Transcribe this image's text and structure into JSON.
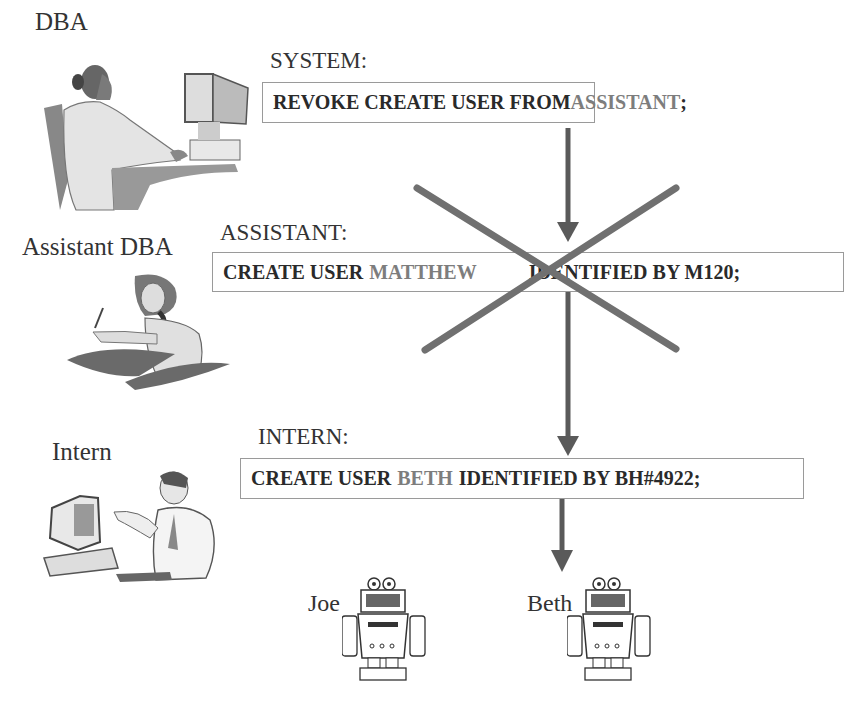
{
  "actors": [
    {
      "id": "dba",
      "label": "DBA",
      "icon": "woman-at-computer-icon"
    },
    {
      "id": "assistant",
      "label": "Assistant DBA",
      "icon": "woman-on-phone-icon"
    },
    {
      "id": "intern",
      "label": "Intern",
      "icon": "man-at-computer-icon"
    }
  ],
  "steps": [
    {
      "role": "SYSTEM:",
      "command": {
        "kw1": "REVOKE CREATE USER FROM",
        "target": "ASSISTANT",
        "end": ";"
      }
    },
    {
      "role": "ASSISTANT:",
      "command": {
        "kw1": "CREATE USER",
        "target": "MATTHEW",
        "kw2": "IDENTIFIED BY M120;"
      },
      "status": "crossed-out"
    },
    {
      "role": "INTERN:",
      "command": {
        "kw1": "CREATE USER",
        "target": "BETH",
        "kw2": "IDENTIFIED BY BH#4922;"
      }
    }
  ],
  "users": [
    {
      "name": "Joe",
      "icon": "robot-icon"
    },
    {
      "name": "Beth",
      "icon": "robot-icon"
    }
  ],
  "colors": {
    "arrow": "#5a5a5a",
    "cross": "#707070",
    "box_border": "#9a9a9a",
    "highlight_text": "#7d7d7d"
  }
}
